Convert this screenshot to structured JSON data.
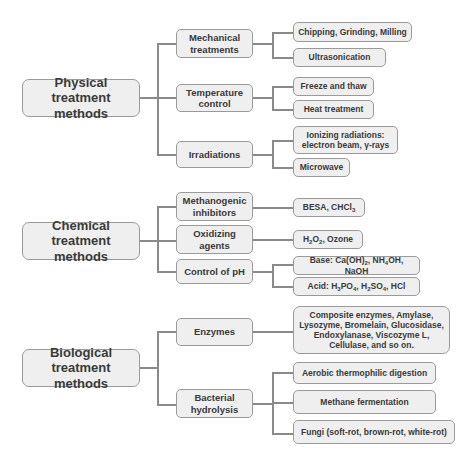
{
  "diagram": {
    "groups": [
      {
        "label": "Physical treatment methods",
        "line1": "Physical",
        "line2": "treatment methods",
        "children": [
          {
            "line1": "Mechanical",
            "line2": "treatments",
            "leaves": [
              "Chipping, Grinding, Milling",
              "Ultrasonication"
            ]
          },
          {
            "line1": "Temperature",
            "line2": "control",
            "leaves": [
              "Freeze and thaw",
              "Heat treatment"
            ]
          },
          {
            "line1": "Irradiations",
            "line2": "",
            "leaves": [
              "Ionizing radiations: electron beam, γ-rays",
              "Microwave"
            ],
            "leaf0_line1": "Ionizing radiations:",
            "leaf0_line2": "electron beam, γ-rays"
          }
        ]
      },
      {
        "label": "Chemical treatment methods",
        "line1": "Chemical",
        "line2": "treatment methods",
        "children": [
          {
            "line1": "Methanogenic",
            "line2": "inhibitors",
            "leaves": [
              "BESA, CHCl3"
            ]
          },
          {
            "line1": "Oxidizing",
            "line2": "agents",
            "leaves": [
              "H2O2, Ozone"
            ]
          },
          {
            "line1": "Control of pH",
            "line2": "",
            "leaves": [
              "Base: Ca(OH)2, NH4OH, NaOH",
              "Acid: H3PO4, H2SO4, HCl"
            ]
          }
        ]
      },
      {
        "label": "Biological treatment methods",
        "line1": "Biological",
        "line2": "treatment methods",
        "children": [
          {
            "line1": "Enzymes",
            "line2": "",
            "leaves": [
              "Composite enzymes, Amylase, Lysozyme, Bromelain, Glucosidase, Endoxylanase, Viscozyme L, Cellulase, and so on."
            ],
            "leaf0_lines": [
              "Composite enzymes, Amylase,",
              "Lysozyme, Bromelain, Glucosidase,",
              "Endoxylanase, Viscozyme L,",
              "Cellulase, and so on."
            ]
          },
          {
            "line1": "Bacterial",
            "line2": "hydrolysis",
            "leaves": [
              "Aerobic thermophilic digestion",
              "Methane fermentation",
              "Fungi (soft-rot, brown-rot, white-rot)"
            ]
          }
        ]
      }
    ],
    "chem_parts": {
      "besa": "BESA, CHCl",
      "besa_sub": "3",
      "h2o2_a": "H",
      "h2o2_s1": "2",
      "h2o2_b": "O",
      "h2o2_s2": "2",
      "h2o2_c": ", Ozone",
      "base_a": "Base: Ca(OH)",
      "base_s1": "2",
      "base_b": ", NH",
      "base_s2": "4",
      "base_c": "OH, NaOH",
      "acid_a": "Acid: H",
      "acid_s1": "3",
      "acid_b": "PO",
      "acid_s2": "4",
      "acid_c": ", H",
      "acid_s3": "2",
      "acid_d": "SO",
      "acid_s4": "4",
      "acid_e": ", HCl"
    },
    "colors": {
      "box_fill": "#efefef",
      "box_border": "#9a9a9a",
      "connector": "#8a8a8a",
      "text": "#3a3a3a"
    }
  }
}
